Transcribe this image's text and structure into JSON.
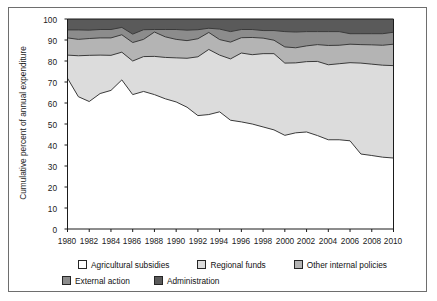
{
  "chart_data": {
    "type": "area",
    "title": "",
    "subtitle": "",
    "xlabel": "",
    "ylabel": "Cumulative percent of annual expenditure",
    "stacked": true,
    "cumulative": true,
    "grid": false,
    "legend_position": "bottom",
    "xlim": [
      1980,
      2010
    ],
    "ylim": [
      0,
      100
    ],
    "ytick_step": 10,
    "xtick_step": 2,
    "yticks": [
      0,
      10,
      20,
      30,
      40,
      50,
      60,
      70,
      80,
      90,
      100
    ],
    "xticks": [
      1980,
      1982,
      1984,
      1986,
      1988,
      1990,
      1992,
      1994,
      1996,
      1998,
      2000,
      2002,
      2004,
      2006,
      2008,
      2010
    ],
    "x": [
      1980,
      1981,
      1982,
      1983,
      1984,
      1985,
      1986,
      1987,
      1988,
      1989,
      1990,
      1991,
      1992,
      1993,
      1994,
      1995,
      1996,
      1997,
      1998,
      1999,
      2000,
      2001,
      2002,
      2003,
      2004,
      2005,
      2006,
      2007,
      2008,
      2009,
      2010
    ],
    "series": [
      {
        "name": "Agricultural subsidies",
        "color": "#ffffff",
        "values": [
          71.8,
          63.0,
          60.7,
          64.5,
          66.0,
          71.0,
          64.0,
          65.5,
          64.0,
          62.0,
          60.5,
          58.0,
          54.0,
          54.5,
          55.8,
          51.8,
          51.0,
          50.0,
          48.6,
          47.2,
          44.6,
          45.8,
          46.2,
          44.5,
          42.5,
          42.5,
          42.0,
          35.7,
          35.0,
          34.2,
          33.8
        ]
      },
      {
        "name": "Regional funds",
        "color": "#dcdcdc",
        "values": [
          11.0,
          19.5,
          22.0,
          18.3,
          16.7,
          13.2,
          16.0,
          16.6,
          18.2,
          19.7,
          21.0,
          23.3,
          28.0,
          31.0,
          27.0,
          29.2,
          32.8,
          33.0,
          34.9,
          36.3,
          34.4,
          33.3,
          33.5,
          35.3,
          35.7,
          36.2,
          37.2,
          43.3,
          43.5,
          43.8,
          44.0
        ]
      },
      {
        "name": "Other internal policies",
        "color": "#b4b4b4",
        "values": [
          8.2,
          7.8,
          8.0,
          8.2,
          8.3,
          8.3,
          8.8,
          8.2,
          11.6,
          9.8,
          8.8,
          8.4,
          8.6,
          8.1,
          7.4,
          8.0,
          7.3,
          8.2,
          7.4,
          6.4,
          7.7,
          7.2,
          7.5,
          8.0,
          9.2,
          8.8,
          8.8,
          8.8,
          9.2,
          9.5,
          10.2
        ]
      },
      {
        "name": "External action",
        "color": "#8c8c8c",
        "values": [
          3.8,
          4.5,
          4.0,
          4.0,
          4.0,
          3.5,
          4.0,
          4.6,
          1.2,
          3.5,
          4.7,
          5.0,
          4.3,
          2.0,
          5.0,
          5.0,
          3.9,
          3.8,
          3.6,
          4.6,
          7.3,
          7.5,
          6.8,
          6.2,
          6.6,
          6.5,
          5.0,
          5.2,
          5.3,
          5.5,
          5.7
        ]
      },
      {
        "name": "Administration",
        "color": "#5a5a5a",
        "values": [
          5.2,
          5.2,
          5.3,
          5.0,
          5.0,
          4.0,
          7.2,
          5.1,
          5.0,
          5.0,
          5.0,
          5.3,
          5.1,
          4.4,
          4.8,
          6.0,
          5.0,
          5.0,
          5.5,
          5.5,
          6.0,
          6.2,
          6.0,
          6.0,
          6.0,
          6.0,
          7.0,
          7.0,
          7.0,
          7.0,
          6.3
        ]
      }
    ],
    "cumulative_boundaries": {
      "agricultural_subsidies_top": [
        71.8,
        63.0,
        60.7,
        64.5,
        66.0,
        71.0,
        64.0,
        65.5,
        64.0,
        62.0,
        60.5,
        58.0,
        54.0,
        54.5,
        55.8,
        51.8,
        51.0,
        50.0,
        48.6,
        47.2,
        44.6,
        45.8,
        46.2,
        44.5,
        42.5,
        42.5,
        42.0,
        35.7,
        35.0,
        34.2,
        33.8
      ],
      "regional_funds_top": [
        82.8,
        82.5,
        82.7,
        82.8,
        82.7,
        84.2,
        80.0,
        82.1,
        82.2,
        81.7,
        81.5,
        81.3,
        82.0,
        85.5,
        82.8,
        81.0,
        83.8,
        83.0,
        83.5,
        83.5,
        79.0,
        79.1,
        79.7,
        79.8,
        78.2,
        78.7,
        79.2,
        79.0,
        78.5,
        78.0,
        77.8
      ],
      "other_internal_policies_top": [
        91.0,
        90.3,
        90.7,
        91.0,
        91.0,
        92.5,
        88.8,
        90.3,
        93.8,
        91.5,
        90.3,
        89.7,
        90.6,
        93.6,
        90.2,
        89.0,
        91.1,
        91.2,
        90.9,
        89.9,
        86.7,
        86.3,
        87.2,
        87.8,
        87.4,
        87.5,
        88.0,
        87.8,
        87.7,
        87.5,
        88.0
      ],
      "external_action_top": [
        94.8,
        94.8,
        94.7,
        95.0,
        95.0,
        96.0,
        92.8,
        94.9,
        95.0,
        95.0,
        95.0,
        94.7,
        94.9,
        95.6,
        95.2,
        94.0,
        95.0,
        95.0,
        94.5,
        94.5,
        94.0,
        93.8,
        94.0,
        94.0,
        94.0,
        94.0,
        93.0,
        93.0,
        93.0,
        93.0,
        93.7
      ],
      "administration_top": [
        100,
        100,
        100,
        100,
        100,
        100,
        100,
        100,
        100,
        100,
        100,
        100,
        100,
        100,
        100,
        100,
        100,
        100,
        100,
        100,
        100,
        100,
        100,
        100,
        100,
        100,
        100,
        100,
        100,
        100,
        100
      ]
    }
  },
  "axis": {
    "y_title": "Cumulative percent of annual expenditure",
    "y_labels": [
      "100",
      "90",
      "80",
      "70",
      "60",
      "50",
      "40",
      "30",
      "20",
      "10",
      "0"
    ],
    "x_labels": [
      "1980",
      "1982",
      "1984",
      "1986",
      "1988",
      "1990",
      "1992",
      "1994",
      "1996",
      "1998",
      "2000",
      "2002",
      "2004",
      "2006",
      "2008",
      "2010"
    ]
  },
  "legend": {
    "row1": [
      {
        "label": "Agricultural subsidies",
        "color": "#ffffff"
      },
      {
        "label": "Regional funds",
        "color": "#dcdcdc"
      },
      {
        "label": "Other internal policies",
        "color": "#b4b4b4"
      }
    ],
    "row2": [
      {
        "label": "External action",
        "color": "#8c8c8c"
      },
      {
        "label": "Administration",
        "color": "#5a5a5a"
      }
    ]
  },
  "colors": {
    "axis_line": "#1b1b1b",
    "border": "#6e6e6e",
    "series_outline": "#3a3a3a",
    "background": "#ffffff"
  }
}
